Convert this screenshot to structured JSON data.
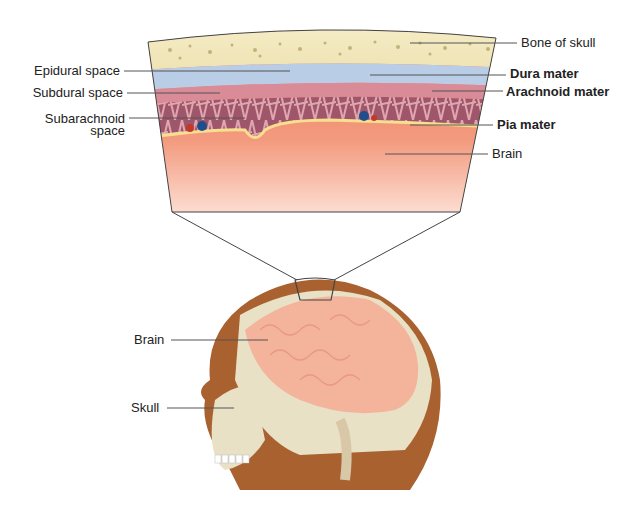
{
  "diagram": {
    "cross_section": {
      "left_labels": [
        {
          "text": "Epidural space"
        },
        {
          "text": "Subdural space"
        },
        {
          "text": "Subarachnoid space",
          "lines": [
            "Subarachnoid",
            "space"
          ]
        }
      ],
      "right_labels": [
        {
          "text": "Bone of skull",
          "bold": false
        },
        {
          "text": "Dura mater",
          "bold": true
        },
        {
          "text": "Arachnoid mater",
          "bold": true
        },
        {
          "text": "Pia mater",
          "bold": true
        },
        {
          "text": "Brain",
          "bold": false
        }
      ]
    },
    "head": {
      "labels": [
        {
          "text": "Brain"
        },
        {
          "text": "Skull"
        }
      ]
    },
    "colors": {
      "bone": "#efe3b4",
      "bone_spongy": "#b9a36a",
      "dura": "#b9cde6",
      "arachnoid": "#d98b98",
      "arachnoid_web": "#9b4f63",
      "pia": "#f6df8e",
      "brain_tissue": "#ef8a6a",
      "brain_head": "#f4b39b",
      "skin": "#a8612f",
      "skull_head": "#e8e1c6",
      "leader_line": "#555555"
    }
  }
}
